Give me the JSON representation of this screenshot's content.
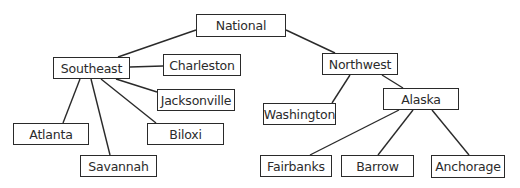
{
  "diagram": {
    "type": "tree",
    "root": "national",
    "nodes": [
      {
        "id": "national",
        "label": "National",
        "x": 196,
        "y": 14,
        "w": 90,
        "h": 23
      },
      {
        "id": "southeast",
        "label": "Southeast",
        "x": 53,
        "y": 57,
        "w": 77,
        "h": 22
      },
      {
        "id": "charleston",
        "label": "Charleston",
        "x": 163,
        "y": 54,
        "w": 78,
        "h": 22
      },
      {
        "id": "jacksonville",
        "label": "Jacksonville",
        "x": 157,
        "y": 89,
        "w": 78,
        "h": 22
      },
      {
        "id": "atlanta",
        "label": "Atlanta",
        "x": 13,
        "y": 123,
        "w": 76,
        "h": 22
      },
      {
        "id": "biloxi",
        "label": "Biloxi",
        "x": 147,
        "y": 123,
        "w": 77,
        "h": 22
      },
      {
        "id": "savannah",
        "label": "Savannah",
        "x": 80,
        "y": 155,
        "w": 77,
        "h": 22
      },
      {
        "id": "northwest",
        "label": "Northwest",
        "x": 322,
        "y": 53,
        "w": 76,
        "h": 22
      },
      {
        "id": "washington",
        "label": "Washington",
        "x": 263,
        "y": 103,
        "w": 73,
        "h": 22
      },
      {
        "id": "alaska",
        "label": "Alaska",
        "x": 383,
        "y": 88,
        "w": 76,
        "h": 22
      },
      {
        "id": "fairbanks",
        "label": "Fairbanks",
        "x": 260,
        "y": 155,
        "w": 72,
        "h": 22
      },
      {
        "id": "barrow",
        "label": "Barrow",
        "x": 341,
        "y": 155,
        "w": 73,
        "h": 22
      },
      {
        "id": "anchorage",
        "label": "Anchorage",
        "x": 431,
        "y": 155,
        "w": 74,
        "h": 23
      }
    ],
    "edges": [
      {
        "from": "national",
        "to": "southeast",
        "x1": 196,
        "y1": 30,
        "x2": 118,
        "y2": 57
      },
      {
        "from": "national",
        "to": "northwest",
        "x1": 286,
        "y1": 30,
        "x2": 335,
        "y2": 53
      },
      {
        "from": "southeast",
        "to": "charleston",
        "x1": 130,
        "y1": 67,
        "x2": 163,
        "y2": 66
      },
      {
        "from": "southeast",
        "to": "jacksonville",
        "x1": 116,
        "y1": 79,
        "x2": 157,
        "y2": 92
      },
      {
        "from": "southeast",
        "to": "atlanta",
        "x1": 80,
        "y1": 79,
        "x2": 63,
        "y2": 123
      },
      {
        "from": "southeast",
        "to": "savannah",
        "x1": 91,
        "y1": 79,
        "x2": 110,
        "y2": 155
      },
      {
        "from": "southeast",
        "to": "biloxi",
        "x1": 101,
        "y1": 79,
        "x2": 156,
        "y2": 123
      },
      {
        "from": "northwest",
        "to": "washington",
        "x1": 350,
        "y1": 75,
        "x2": 332,
        "y2": 103
      },
      {
        "from": "northwest",
        "to": "alaska",
        "x1": 382,
        "y1": 75,
        "x2": 403,
        "y2": 88
      },
      {
        "from": "alaska",
        "to": "fairbanks",
        "x1": 399,
        "y1": 110,
        "x2": 310,
        "y2": 155
      },
      {
        "from": "alaska",
        "to": "barrow",
        "x1": 413,
        "y1": 110,
        "x2": 378,
        "y2": 155
      },
      {
        "from": "alaska",
        "to": "anchorage",
        "x1": 432,
        "y1": 110,
        "x2": 469,
        "y2": 155
      }
    ],
    "colors": {
      "stroke": "#2a2a2a",
      "text": "#2b2b2b",
      "background": "#ffffff"
    }
  }
}
